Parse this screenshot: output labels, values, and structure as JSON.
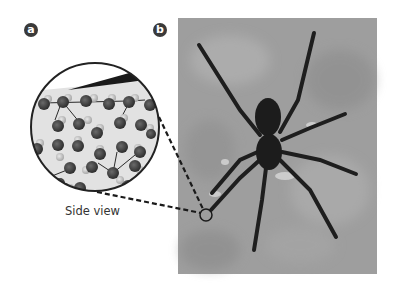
{
  "figure": {
    "panels": [
      {
        "label": "a",
        "description": "Magnified side view of water surface molecules under spider leg"
      },
      {
        "label": "b",
        "description": "Photograph of spider standing on water surface"
      }
    ],
    "caption": "Side view",
    "colors": {
      "badge": "#3a3a3a",
      "photo_background": "#9c9c9c",
      "spider": "#1e1e1e",
      "water_inset": "#e4e4e4",
      "molecule": "#4a4a4a",
      "dashed_line": "#1a1a1a"
    }
  }
}
